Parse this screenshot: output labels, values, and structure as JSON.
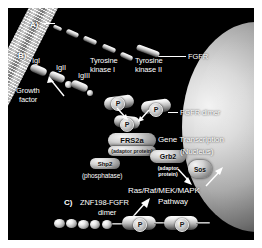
{
  "figure": {
    "background_color": "#000000",
    "frame_color": "#ffffff"
  },
  "sections": {
    "a_label": "A)",
    "b_label": "B)",
    "c_label": "C)"
  },
  "labels": {
    "ig1": "IgI",
    "ig2": "IgII",
    "ig3": "IgIII",
    "growth_factor_line1": "Growth",
    "growth_factor_line2": "factor",
    "tyrosine_kinase_1_line1": "Tyrosine",
    "tyrosine_kinase_1_line2": "kinase I",
    "tyrosine_kinase_2_line1": "Tyrosine",
    "tyrosine_kinase_2_line2": "kinase II",
    "fgfr": "FGFR",
    "fgfr_dimer": "FGFR dimer",
    "phosphatase": "(phosphatase)",
    "znf198_line1": "ZNF198-FGFR",
    "znf198_line2": "dimer",
    "gene_transcription_line1": "Gene Transcription",
    "gene_transcription_line2": "(Nucleus)",
    "pathway_line1": "Ras/Raf/MEK/MAPK",
    "pathway_line2": "Pathway"
  },
  "proteins": {
    "frs2a": {
      "name": "FRS2a",
      "role": "(adaptor protein)"
    },
    "grb2": {
      "name": "Grb2",
      "role_line1": "(adaptor",
      "role_line2": "protein)"
    },
    "sos": {
      "name": "Sos"
    },
    "shp2": {
      "name": "Shp2"
    }
  },
  "phosphates": {
    "marker": "P",
    "count": 5
  }
}
